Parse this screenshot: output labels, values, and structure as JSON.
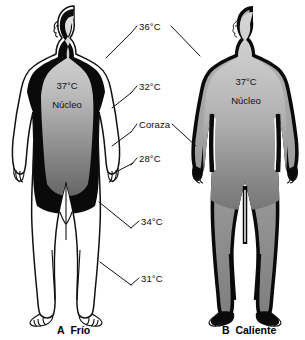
{
  "figure": {
    "title_visible": false,
    "background_color": "#ffffff",
    "ink_color": "#000000"
  },
  "panel_a": {
    "letter": "A",
    "caption": "Frío",
    "core_temp": "37°C",
    "core_label": "Núcleo",
    "shell_color": "#050505",
    "core_gradient_top": "#d8d8d8",
    "core_gradient_bottom": "#6e6e6e",
    "periphery_color": "#ffffff"
  },
  "panel_b": {
    "letter": "B",
    "caption": "Caliente",
    "core_temp": "37°C",
    "core_label": "Núcleo",
    "shell_color": "#080808",
    "core_gradient_top": "#cfcfcf",
    "core_gradient_bottom": "#787878",
    "periphery_color": "#9a9a9a"
  },
  "leader_labels": [
    {
      "text": "36°C",
      "name": "temp-label-36c"
    },
    {
      "text": "32°C",
      "name": "temp-label-32c"
    },
    {
      "text": "Coraza",
      "name": "shell-label-coraza"
    },
    {
      "text": "28°C",
      "name": "temp-label-28c"
    },
    {
      "text": "34°C",
      "name": "temp-label-34c"
    },
    {
      "text": "31°C",
      "name": "temp-label-31c"
    }
  ]
}
